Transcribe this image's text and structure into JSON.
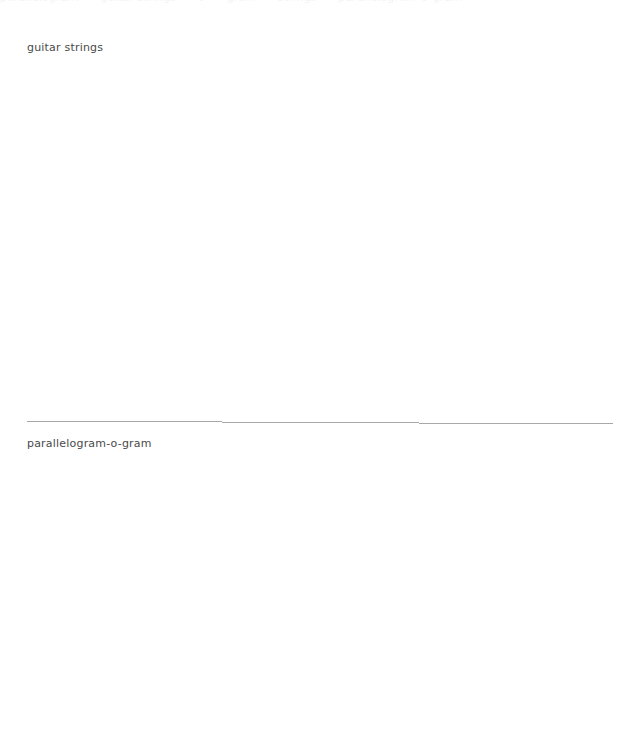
{
  "page": {
    "width": 629,
    "height": 742,
    "background_color": "#ffffff",
    "text_color": "#4a4a4a",
    "divider_color": "#a8a8a8"
  },
  "top_clipped_row": {
    "description": "bottom sliver of a text line clipped by the top edge, illegible",
    "faint_color": "#f4f4f5",
    "segments": [
      "parallelogram",
      "guitar strings",
      "o",
      "gram",
      "strings",
      "parallelogram-o-gram"
    ]
  },
  "sections": [
    {
      "label": "guitar strings",
      "has_divider_above": false
    },
    {
      "label": "parallelogram-o-gram",
      "has_divider_above": true
    }
  ]
}
